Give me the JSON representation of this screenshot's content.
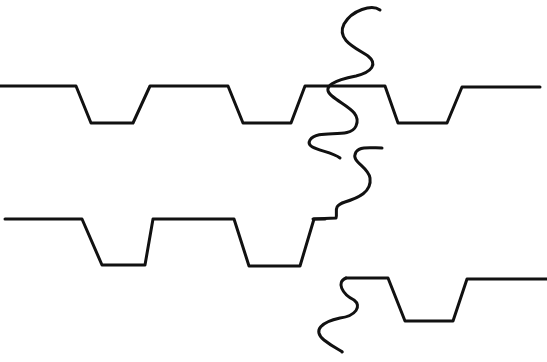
{
  "diagram": {
    "stroke_color": "#111111",
    "background": "#ffffff",
    "rows": [
      {
        "name": "top-waveform",
        "path": "M0 86 L76 86 L91 123 L133 123 L150 86 L228 86 L243 123 L291 123 L305 86 L385 86 L398 123 L447 123 L462 87 L540 87"
      },
      {
        "name": "middle-waveform",
        "path": "M5 219 L82 219 L102 265 L145 265 L153 219 L234 219 L249 266 L300 266 L314 219 L325 219"
      },
      {
        "name": "bottom-waveform",
        "path": "M346 278 L388 278 L405 321 L453 321 L467 279 L547 279"
      }
    ],
    "breaks": [
      {
        "name": "top-break-wave",
        "path": "M380 10 C372 4 352 10 344 24 C336 40 356 48 368 56 C378 64 372 72 356 76 C336 80 320 86 332 96 C344 106 362 112 356 126 C350 140 318 128 310 140 C304 150 330 150 340 158"
      },
      {
        "name": "middle-break-wave",
        "path": "M313 219 L336 218 C338 212 332 206 345 202 C358 198 372 192 370 178 C368 166 350 162 356 152 C360 146 372 148 382 148"
      },
      {
        "name": "bottom-break-wave",
        "path": "M346 278 C336 282 342 294 354 300 C362 306 356 316 340 318 C322 322 312 330 324 340 C334 348 344 352 342 352"
      }
    ]
  }
}
